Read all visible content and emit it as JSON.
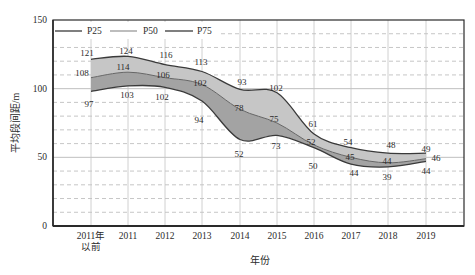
{
  "chart_data": {
    "type": "area",
    "title": "",
    "xlabel": "年份",
    "ylabel": "平均段间距/m",
    "categories": [
      "2011年以前",
      "2011",
      "2012",
      "2013",
      "2014",
      "2015",
      "2016",
      "2017",
      "2018",
      "2019"
    ],
    "series": [
      {
        "name": "P25",
        "values": [
          97,
          103,
          102,
          94,
          52,
          73,
          50,
          44,
          39,
          44
        ]
      },
      {
        "name": "P50",
        "values": [
          108,
          114,
          106,
          102,
          78,
          75,
          52,
          45,
          44,
          46
        ]
      },
      {
        "name": "P75",
        "values": [
          121,
          124,
          116,
          113,
          93,
          102,
          61,
          54,
          48,
          49
        ]
      }
    ],
    "ylim": [
      0,
      150
    ],
    "yticks": [
      0,
      50,
      100,
      150
    ],
    "grid": {
      "solid_lines": [
        50,
        100
      ],
      "dashed_step": 10,
      "vertical_at_categories": true
    },
    "legend": {
      "position": "top-left",
      "entries": [
        "P25",
        "P50",
        "P75"
      ]
    },
    "annotations": "data value labels placed next to each point of every series"
  },
  "render": {
    "plot": {
      "x0": 53,
      "x1": 464,
      "y0": 20,
      "y1": 226
    },
    "category_x": [
      91,
      128,
      165,
      202,
      240,
      277,
      314,
      351,
      388,
      426
    ],
    "category_label_lines": {
      "0": [
        "2011年",
        "以前"
      ]
    },
    "category_label_y": 236,
    "curves": {
      "P75": [
        121.4,
        123.5,
        117.5,
        112.5,
        99.5,
        97,
        67,
        57,
        53,
        53
      ],
      "P50": [
        108,
        112,
        108,
        103,
        85,
        75,
        59,
        50,
        46,
        49
      ],
      "P25": [
        98,
        102,
        101,
        91,
        63,
        66,
        57,
        45,
        43,
        47
      ]
    },
    "labels": {
      "P75": [
        [
          87,
          53
        ],
        [
          126,
          51
        ],
        [
          166,
          55
        ],
        [
          201,
          62
        ],
        [
          242,
          82
        ],
        [
          276,
          88
        ],
        [
          313,
          124
        ],
        [
          348,
          142
        ],
        [
          391,
          145
        ],
        [
          426,
          149
        ]
      ],
      "P50": [
        [
          82,
          73
        ],
        [
          123,
          67
        ],
        [
          163,
          75
        ],
        [
          200,
          83
        ],
        [
          239,
          108
        ],
        [
          274,
          119
        ],
        [
          311,
          142
        ],
        [
          350,
          157
        ],
        [
          387,
          161
        ],
        [
          436,
          158
        ]
      ],
      "P25": [
        [
          89,
          104
        ],
        [
          127,
          95
        ],
        [
          162,
          97
        ],
        [
          199,
          120
        ],
        [
          239,
          154
        ],
        [
          276,
          146
        ],
        [
          313,
          166
        ],
        [
          354,
          173
        ],
        [
          387,
          177
        ],
        [
          426,
          171
        ]
      ]
    },
    "colors": {
      "band_upper": "#c6c6c6",
      "band_lower": "#a3a3a3",
      "line_P75": "#3a3a3a",
      "line_P50": "#666666",
      "line_P25": "#3a3a3a",
      "legend_P25": "#3a3a3a",
      "legend_P50": "#9a9a9a",
      "legend_P75": "#3a3a3a",
      "grid": "#b8b8b8",
      "axis": "#2a2a2a"
    },
    "legend_box": {
      "x": 54,
      "y": 22,
      "w": 164,
      "h": 17
    }
  }
}
